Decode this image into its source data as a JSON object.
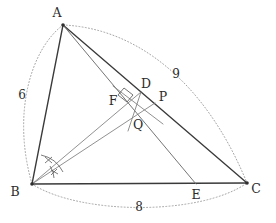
{
  "figure": {
    "background_color": "#ffffff",
    "stroke_color": "#3a3a3a",
    "thin_stroke_color": "#7d7d7d",
    "arc_color": "#9a9a9a"
  },
  "vertices": {
    "A": {
      "label": "A",
      "x": 63,
      "y": 25,
      "label_x": 57,
      "label_y": 17
    },
    "B": {
      "label": "B",
      "x": 32,
      "y": 184,
      "label_x": 15,
      "label_y": 196
    },
    "C": {
      "label": "C",
      "x": 247,
      "y": 183,
      "label_x": 253,
      "label_y": 193
    },
    "D": {
      "label": "D",
      "x": 141,
      "y": 92,
      "label_x": 143,
      "label_y": 87
    },
    "E": {
      "label": "E",
      "x": 196,
      "y": 184,
      "label_x": 192,
      "label_y": 198
    },
    "F": {
      "label": "F",
      "x": 125,
      "y": 101,
      "label_x": 113,
      "label_y": 105
    },
    "P": {
      "label": "P",
      "x": 155,
      "y": 103,
      "label_x": 158,
      "label_y": 101
    },
    "Q": {
      "label": "Q",
      "x": 136,
      "y": 120,
      "label_x": 136,
      "label_y": 128
    }
  },
  "side_labels": [
    {
      "name": "side-ab-length",
      "text": "6",
      "x": 22,
      "y": 99
    },
    {
      "name": "side-ac-length",
      "text": "9",
      "x": 175,
      "y": 77
    },
    {
      "name": "side-bc-length",
      "text": "8",
      "x": 139,
      "y": 210
    }
  ],
  "marks": {
    "right_angle_at": "F",
    "equal_angle_ticks_at": "B",
    "angle_tick_count": 2
  }
}
